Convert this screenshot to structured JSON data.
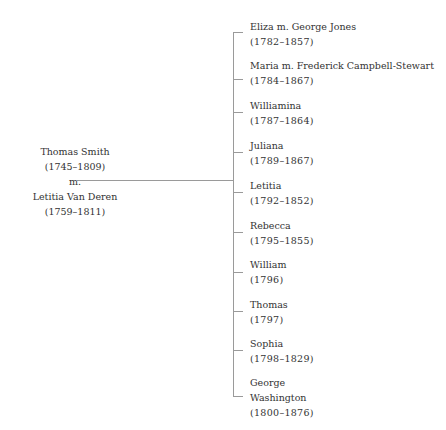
{
  "parents": {
    "father": {
      "name": "Thomas Smith",
      "dates": "(1745–1809)"
    },
    "marriage": "m.",
    "mother": {
      "name": "Letitia Van Deren",
      "dates": "(1759–1811)"
    }
  },
  "children": [
    {
      "name": "Eliza m. George Jones",
      "dates": "(1782–1857)"
    },
    {
      "name": "Maria m. Frederick Campbell-Stewart",
      "dates": "(1784–1867)"
    },
    {
      "name": "Williamina",
      "dates": "(1787–1864)"
    },
    {
      "name": "Juliana",
      "dates": "(1789–1867)"
    },
    {
      "name": "Letitia",
      "dates": "(1792–1852)"
    },
    {
      "name": "Rebecca",
      "dates": "(1795–1855)"
    },
    {
      "name": "William",
      "dates": "(1796)"
    },
    {
      "name": "Thomas",
      "dates": "(1797)"
    },
    {
      "name": "Sophia",
      "dates": "(1798–1829)"
    },
    {
      "name": "George",
      "name2": "Washington",
      "dates": "(1800–1876)"
    }
  ],
  "colors": {
    "line": "#9a9a9a",
    "text": "#333333"
  }
}
